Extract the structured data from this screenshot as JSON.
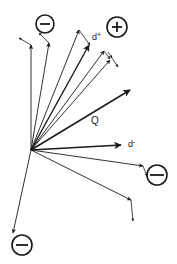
{
  "diagram": {
    "origin": [
      31,
      150
    ],
    "colors": {
      "stroke": "#1a1a1a",
      "background": "#ffffff"
    },
    "labels": {
      "q": "Q",
      "d_plus": "d+",
      "d_minus": "d-"
    },
    "charges": [
      {
        "id": "neg-top",
        "sign": "minus",
        "cx": 45,
        "cy": 24,
        "r": 9
      },
      {
        "id": "pos-top-right",
        "sign": "plus",
        "cx": 117,
        "cy": 27,
        "r": 10
      },
      {
        "id": "neg-right",
        "sign": "minus",
        "cx": 157,
        "cy": 175,
        "r": 10
      },
      {
        "id": "neg-bottom-left",
        "sign": "minus",
        "cx": 22,
        "cy": 245,
        "r": 10
      }
    ],
    "arrows": [
      {
        "id": "v1",
        "to": [
          31,
          45
        ],
        "kink": [
          20,
          38
        ]
      },
      {
        "id": "v2",
        "to": [
          49,
          43
        ],
        "kink": [
          40,
          33
        ]
      },
      {
        "id": "v3",
        "to": [
          79,
          30
        ],
        "kink": [
          90,
          44
        ]
      },
      {
        "id": "v4",
        "to": [
          89,
          45
        ],
        "thick": true
      },
      {
        "id": "v5",
        "to": [
          104,
          51
        ],
        "kink": [
          110,
          58
        ]
      },
      {
        "id": "v6",
        "to": [
          110,
          60
        ],
        "kink": [
          118,
          66
        ]
      },
      {
        "id": "q",
        "to": [
          130,
          90
        ],
        "thick": true
      },
      {
        "id": "d-minus",
        "to": [
          121,
          145
        ],
        "thick": true
      },
      {
        "id": "v9",
        "to": [
          143,
          166
        ],
        "kink": [
          148,
          175
        ]
      },
      {
        "id": "v10",
        "to": [
          131,
          200
        ],
        "kink": [
          133,
          220
        ]
      },
      {
        "id": "v11",
        "to": [
          13,
          233
        ]
      }
    ]
  }
}
